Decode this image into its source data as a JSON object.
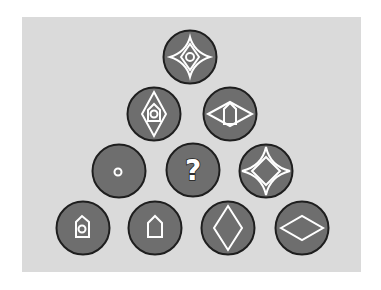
{
  "puzzle": {
    "type": "visual-pattern-pyramid",
    "background_color": "#dadada",
    "circle_fill": "#6e6e6e",
    "circle_stroke": "#1e1e1e",
    "symbol_color": "#ffffff",
    "rows": [
      [
        {
          "id": "r1c1",
          "symbol": "four-point-star-with-small-diamond-and-circle"
        }
      ],
      [
        {
          "id": "r2c1",
          "symbol": "tall-diamond-with-house-and-circle"
        },
        {
          "id": "r2c2",
          "symbol": "wide-diamond-with-house"
        }
      ],
      [
        {
          "id": "r3c1",
          "symbol": "small-circle"
        },
        {
          "id": "r3c2",
          "symbol": "question-mark",
          "label": "?"
        },
        {
          "id": "r3c3",
          "symbol": "four-point-star-with-diamond"
        }
      ],
      [
        {
          "id": "r4c1",
          "symbol": "house-with-circle"
        },
        {
          "id": "r4c2",
          "symbol": "house"
        },
        {
          "id": "r4c3",
          "symbol": "tall-diamond"
        },
        {
          "id": "r4c4",
          "symbol": "wide-diamond"
        }
      ]
    ],
    "unknown_label": "?"
  }
}
